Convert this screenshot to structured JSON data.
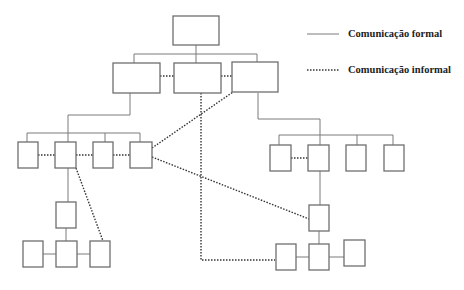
{
  "diagram": {
    "type": "organizational-chart",
    "legend": {
      "formal_label": "Comunicação formal",
      "informal_label": "Comunicação informal"
    },
    "nodes": {
      "top": 1,
      "level2": 3,
      "left_branch_level3": 4,
      "right_branch_level3": 4,
      "left_branch_sub": 1,
      "left_branch_bottom": 3,
      "right_branch_sub": 1,
      "right_branch_bottom": 3
    },
    "colors": {
      "box_stroke": "#6f6f6f",
      "formal_line": "#7a7a7a",
      "informal_line": "#333333",
      "background": "#ffffff"
    }
  }
}
